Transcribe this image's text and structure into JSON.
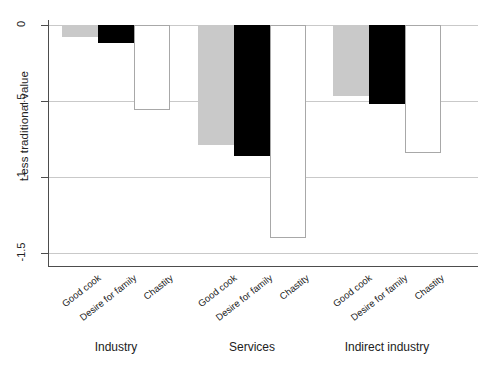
{
  "chart_data": {
    "type": "bar",
    "title": "",
    "subtitle": "",
    "xlabel": "",
    "ylabel": "Less traditional value",
    "ylim": [
      -1.5,
      0
    ],
    "grid": true,
    "legend": "none",
    "orientation": "vertical",
    "groups": [
      "Industry",
      "Services",
      "Indirect industry"
    ],
    "categories": [
      "Good cook",
      "Desire for family",
      "Chastity"
    ],
    "y_ticks": [
      {
        "label": "0",
        "value": 0
      },
      {
        "label": "-.5",
        "value": -0.5
      },
      {
        "label": "-1",
        "value": -1
      },
      {
        "label": "-1.5",
        "value": -1.5
      }
    ],
    "series": [
      {
        "name": "Good cook",
        "fill": "#c9c9c9",
        "values": [
          -0.08,
          -0.79,
          -0.47
        ]
      },
      {
        "name": "Desire for family",
        "fill": "#000000",
        "values": [
          -0.12,
          -0.86,
          -0.52
        ]
      },
      {
        "name": "Chastity",
        "fill": "#ffffff",
        "values": [
          -0.56,
          -1.4,
          -0.84
        ]
      }
    ],
    "bars": [
      {
        "group": "Industry",
        "category": "Good cook",
        "value": -0.08,
        "fill": "gray"
      },
      {
        "group": "Industry",
        "category": "Desire for family",
        "value": -0.12,
        "fill": "black"
      },
      {
        "group": "Industry",
        "category": "Chastity",
        "value": -0.56,
        "fill": "white"
      },
      {
        "group": "Services",
        "category": "Good cook",
        "value": -0.79,
        "fill": "gray"
      },
      {
        "group": "Services",
        "category": "Desire for family",
        "value": -0.86,
        "fill": "black"
      },
      {
        "group": "Services",
        "category": "Chastity",
        "value": -1.4,
        "fill": "white"
      },
      {
        "group": "Indirect industry",
        "category": "Good cook",
        "value": -0.47,
        "fill": "gray"
      },
      {
        "group": "Indirect industry",
        "category": "Desire for family",
        "value": -0.52,
        "fill": "black"
      },
      {
        "group": "Indirect industry",
        "category": "Chastity",
        "value": -0.84,
        "fill": "white"
      }
    ],
    "colors": {
      "good_cook": "#c9c9c9",
      "desire_for_family": "#000000",
      "chastity": "#ffffff",
      "axis": "#4d4d4d",
      "grid": "#c9c9c9",
      "text": "#222222",
      "background": "#ffffff"
    }
  }
}
